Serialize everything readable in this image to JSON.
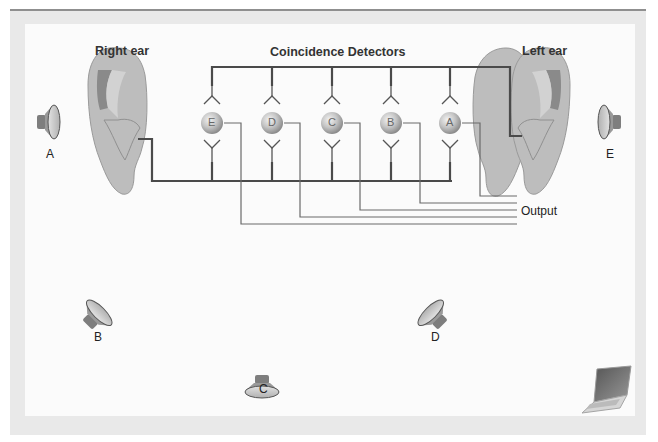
{
  "diagram": {
    "type": "sound-localization-coincidence-detectors",
    "labels": {
      "right_ear": "Right ear",
      "left_ear": "Left ear",
      "title": "Coincidence Detectors",
      "output": "Output"
    },
    "detectors": [
      {
        "id": "E",
        "label": "E"
      },
      {
        "id": "D",
        "label": "D"
      },
      {
        "id": "C",
        "label": "C"
      },
      {
        "id": "B",
        "label": "B"
      },
      {
        "id": "A",
        "label": "A"
      }
    ],
    "speakers": [
      {
        "id": "A",
        "label": "A",
        "position": "left of right ear"
      },
      {
        "id": "B",
        "label": "B",
        "position": "front-right"
      },
      {
        "id": "C",
        "label": "C",
        "position": "front-center"
      },
      {
        "id": "D",
        "label": "D",
        "position": "front-left"
      },
      {
        "id": "E",
        "label": "E",
        "position": "right of left ear"
      }
    ],
    "icons": [
      "speaker-icon",
      "ear-icon",
      "laptop-icon"
    ],
    "colors": {
      "axon_thick": "#4a4a4a",
      "axon_thin": "#6a6a6a",
      "ear_fill": "#b9b9b9",
      "ear_dark": "#8a8a8a",
      "detector_fill": "#c8c8c8",
      "frame": "#e9e9e9",
      "panel": "#fbfbfb"
    }
  }
}
